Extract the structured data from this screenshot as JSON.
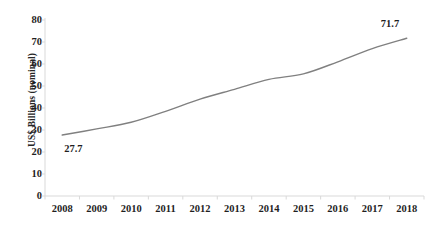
{
  "chart_data": {
    "type": "line",
    "title": "",
    "subtitle": "",
    "xlabel": "",
    "ylabel": "US$ Billions (nominal)",
    "categories": [
      "2008",
      "2009",
      "2010",
      "2011",
      "2012",
      "2013",
      "2014",
      "2015",
      "2016",
      "2017",
      "2018"
    ],
    "x": [
      2008,
      2009,
      2010,
      2011,
      2012,
      2013,
      2014,
      2015,
      2016,
      2017,
      2018
    ],
    "values": [
      27.7,
      30.5,
      33.5,
      38.5,
      44.0,
      48.5,
      53.0,
      55.5,
      61.0,
      67.0,
      71.7
    ],
    "series": [
      {
        "name": "US$ Billions (nominal)",
        "values": [
          27.7,
          30.5,
          33.5,
          38.5,
          44.0,
          48.5,
          53.0,
          55.5,
          61.0,
          67.0,
          71.7
        ]
      }
    ],
    "ylim": [
      0,
      80
    ],
    "yticks": [
      0,
      10,
      20,
      30,
      40,
      50,
      60,
      70,
      80
    ],
    "ytick_labels": [
      "0",
      "10",
      "20",
      "30",
      "40",
      "50",
      "60",
      "70",
      "80"
    ],
    "grid": false,
    "legend": false,
    "legend_position": "none",
    "line_color": "#808080",
    "axis_color": "#d9d9d9",
    "text_color": "#1f1f1f",
    "annotations": [
      {
        "text": "27.7",
        "x": 2008,
        "y": 27.7,
        "position": "below-right"
      },
      {
        "text": "71.7",
        "x": 2018,
        "y": 71.7,
        "position": "above-left"
      }
    ]
  }
}
